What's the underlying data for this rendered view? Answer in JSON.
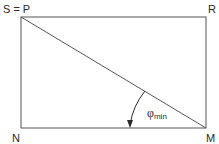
{
  "diagram": {
    "type": "geometry",
    "labels": {
      "top_left": "S = P",
      "top_right": "R",
      "bottom_left": "N",
      "bottom_right": "M",
      "angle_symbol": "φ",
      "angle_subscript": "min"
    },
    "colors": {
      "line": "#555555",
      "text": "#2a2a2a",
      "background": "#ffffff"
    }
  }
}
